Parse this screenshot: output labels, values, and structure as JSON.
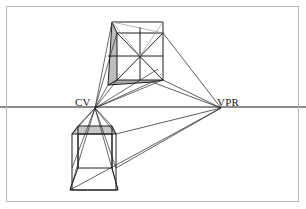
{
  "figure": {
    "type": "line-diagram",
    "canvas": {
      "width": 306,
      "height": 209,
      "background": "#ffffff"
    }
  },
  "frame": {
    "name": "image-border",
    "x": 6,
    "y": 6,
    "width": 293,
    "height": 196,
    "stroke": "#b8b8b8",
    "stroke_width": 1
  },
  "horizon": {
    "label": "horizon-line",
    "y": 107,
    "x1": 0,
    "x2": 306,
    "stroke": "#8c8c8c",
    "stroke_width": 2.2
  },
  "points": {
    "cv": {
      "label": "CV",
      "x": 95,
      "y": 108,
      "label_x": 75,
      "label_y": 106
    },
    "vpr": {
      "label": "VPR",
      "x": 221,
      "y": 108,
      "label_x": 217,
      "label_y": 106
    }
  },
  "colors": {
    "line": "#1f1f1f",
    "line_light": "#4a4a4a",
    "horizon": "#8c8c8c",
    "frame": "#b8b8b8",
    "shade_left": "#b9b9b9",
    "shade_bottom": "#a8a8a8",
    "shade_plan": "#c4c4c4",
    "background": "#ffffff"
  },
  "upper_cube": {
    "name": "perspective-cube",
    "description": "Cube above the horizon drawn in perspective with shaded left and bottom faces and face diagonals",
    "front_face": {
      "x1": 117,
      "y1": 33,
      "x2": 163,
      "y2": 33,
      "x3": 163,
      "y3": 80,
      "x4": 117,
      "y4": 80
    },
    "back_face": {
      "x1": 112,
      "y1": 22,
      "x2": 158,
      "y2": 22,
      "x3": 158,
      "y3": 69,
      "x4": 112,
      "y4": 69
    },
    "top_back_left": {
      "x": 112,
      "y": 22
    },
    "top_back_right": {
      "x": 163,
      "y": 22
    },
    "bottom_left_front": {
      "x": 108,
      "y": 85
    },
    "bottom_right_front": {
      "x": 152,
      "y": 82
    }
  },
  "lower_cube": {
    "name": "plan-view-cube",
    "description": "Cube below the horizon drawn in plan/elevation with shaded top face and construction diagonals",
    "front_face": {
      "x1": 72,
      "y1": 134,
      "x2": 116,
      "y2": 134,
      "x3": 116,
      "y3": 168,
      "x4": 72,
      "y4": 168
    },
    "apex_left": {
      "x": 78,
      "y": 126
    },
    "apex_right": {
      "x": 112,
      "y": 126
    },
    "base_left": {
      "x": 70,
      "y": 190
    },
    "base_right": {
      "x": 118,
      "y": 190
    }
  },
  "rays": {
    "from_cv_label": "visual rays from CV (central vanishing point)",
    "from_vpr_label": "convergence lines to VPR (right vanishing point)",
    "count_cv": 9,
    "count_vpr": 5
  },
  "labels": [
    {
      "name": "cv-label",
      "text": "CV"
    },
    {
      "name": "vpr-label",
      "text": "VPR"
    }
  ]
}
